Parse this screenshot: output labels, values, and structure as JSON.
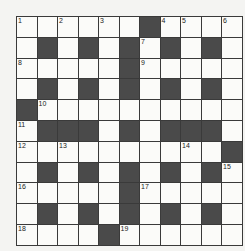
{
  "puzzle": {
    "type": "crossword",
    "size": [
      11,
      11
    ],
    "rows": [
      "......#....",
      ".#.#.#.#.#.",
      ".....#.....",
      ".#.#.#.#.#.",
      "#..........",
      ".###.#.###.",
      "..........#",
      ".#.#.#.#.#.",
      ".....#.....",
      ".#.#.#.#.#.",
      "....#......"
    ],
    "numbers": [
      {
        "row": 0,
        "col": 0,
        "n": "1"
      },
      {
        "row": 0,
        "col": 2,
        "n": "2"
      },
      {
        "row": 0,
        "col": 4,
        "n": "3"
      },
      {
        "row": 0,
        "col": 7,
        "n": "4"
      },
      {
        "row": 0,
        "col": 8,
        "n": "5"
      },
      {
        "row": 0,
        "col": 10,
        "n": "6"
      },
      {
        "row": 1,
        "col": 6,
        "n": "7"
      },
      {
        "row": 2,
        "col": 0,
        "n": "8"
      },
      {
        "row": 2,
        "col": 6,
        "n": "9"
      },
      {
        "row": 4,
        "col": 1,
        "n": "10"
      },
      {
        "row": 5,
        "col": 0,
        "n": "11"
      },
      {
        "row": 6,
        "col": 0,
        "n": "12"
      },
      {
        "row": 6,
        "col": 2,
        "n": "13"
      },
      {
        "row": 6,
        "col": 8,
        "n": "14"
      },
      {
        "row": 7,
        "col": 10,
        "n": "15"
      },
      {
        "row": 8,
        "col": 0,
        "n": "16"
      },
      {
        "row": 8,
        "col": 6,
        "n": "17"
      },
      {
        "row": 10,
        "col": 0,
        "n": "18"
      },
      {
        "row": 10,
        "col": 5,
        "n": "19"
      }
    ],
    "colors": {
      "black_cell": "#4a4a4a",
      "white_cell": "#fbfbf9",
      "grid_line": "#3a3a3a"
    }
  }
}
